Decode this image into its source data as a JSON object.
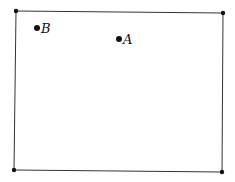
{
  "diagram": {
    "rectangle": {
      "corners": [
        {
          "x": 16,
          "y": 11
        },
        {
          "x": 223,
          "y": 13
        },
        {
          "x": 222,
          "y": 172
        },
        {
          "x": 14,
          "y": 170
        }
      ],
      "stroke": "#333333"
    },
    "points": [
      {
        "label": "B",
        "x": 37,
        "y": 28
      },
      {
        "label": "A",
        "x": 119,
        "y": 39
      }
    ],
    "dot_color": "#111111"
  }
}
